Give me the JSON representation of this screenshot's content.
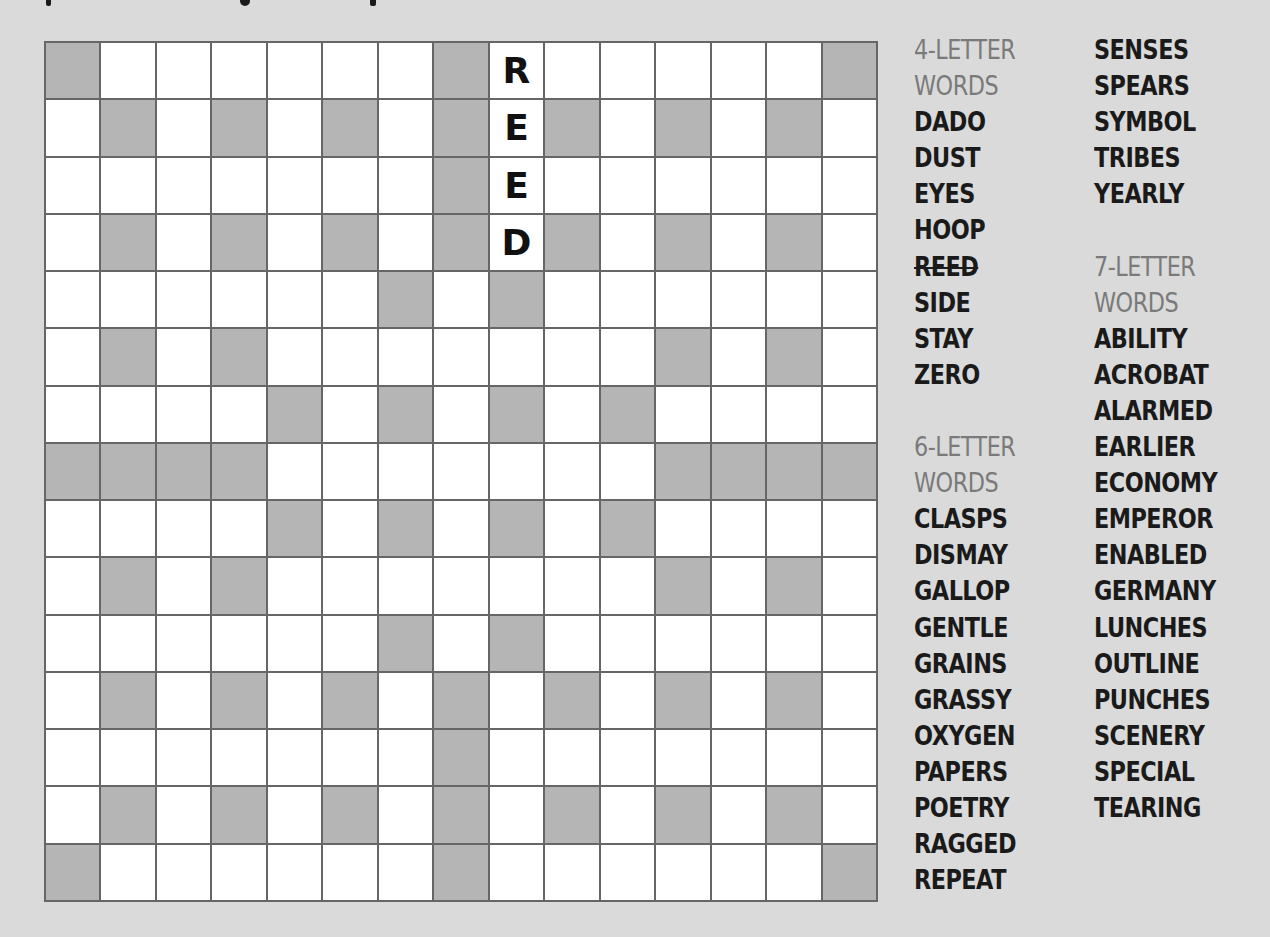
{
  "puzzle": {
    "type": "fill-in crossword",
    "rows": 15,
    "cols": 15,
    "blocks": [
      [
        0,
        7,
        14
      ],
      [
        1,
        3,
        5,
        7,
        9,
        11,
        13
      ],
      [
        7
      ],
      [
        1,
        3,
        5,
        7,
        9,
        11,
        13
      ],
      [
        6,
        8
      ],
      [
        1,
        3,
        11,
        13
      ],
      [
        4,
        6,
        8,
        10
      ],
      [
        0,
        1,
        2,
        3,
        11,
        12,
        13,
        14
      ],
      [
        4,
        6,
        8,
        10
      ],
      [
        1,
        3,
        11,
        13
      ],
      [
        6,
        8
      ],
      [
        1,
        3,
        5,
        7,
        9,
        11,
        13
      ],
      [
        7
      ],
      [
        1,
        3,
        5,
        7,
        9,
        11,
        13
      ],
      [
        0,
        7,
        14
      ]
    ],
    "filled": [
      {
        "row": 0,
        "col": 8,
        "letter": "R"
      },
      {
        "row": 1,
        "col": 8,
        "letter": "E"
      },
      {
        "row": 2,
        "col": 8,
        "letter": "E"
      },
      {
        "row": 3,
        "col": 8,
        "letter": "D"
      }
    ],
    "colors": {
      "background": "#dadada",
      "block": "#b5b5b5",
      "cell": "#ffffff",
      "gridline": "#666666",
      "heading": "#7a7a7a",
      "word": "#1a1a1a"
    }
  },
  "word_lists": {
    "four": {
      "heading_line1": "4-LETTER",
      "heading_line2": "WORDS",
      "words": [
        "DADO",
        "DUST",
        "EYES",
        "HOOP",
        "REED",
        "SIDE",
        "STAY",
        "ZERO"
      ],
      "struck": [
        "REED"
      ]
    },
    "six": {
      "heading_line1": "6-LETTER",
      "heading_line2": "WORDS",
      "words": [
        "CLASPS",
        "DISMAY",
        "GALLOP",
        "GENTLE",
        "GRAINS",
        "GRASSY",
        "OXYGEN",
        "PAPERS",
        "POETRY",
        "RAGGED",
        "REPEAT",
        "SENSES",
        "SPEARS",
        "SYMBOL",
        "TRIBES",
        "YEARLY"
      ]
    },
    "seven": {
      "heading_line1": "7-LETTER",
      "heading_line2": "WORDS",
      "words": [
        "ABILITY",
        "ACROBAT",
        "ALARMED",
        "EARLIER",
        "ECONOMY",
        "EMPEROR",
        "ENABLED",
        "GERMANY",
        "LUNCHES",
        "OUTLINE",
        "PUNCHES",
        "SCENERY",
        "SPECIAL",
        "TEARING"
      ]
    }
  }
}
